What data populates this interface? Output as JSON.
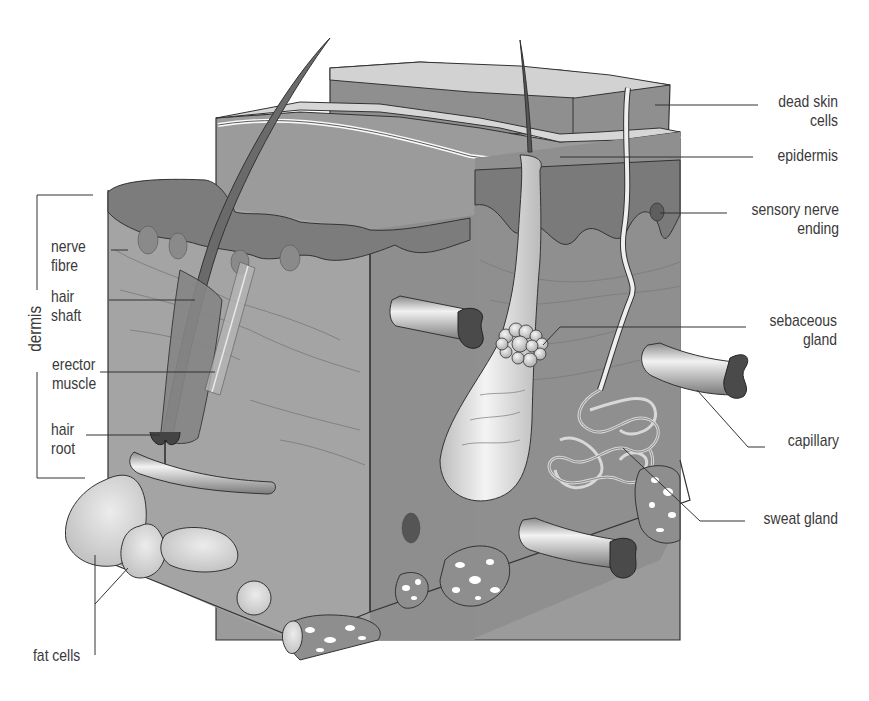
{
  "diagram": {
    "colors": {
      "background": "#ffffff",
      "tissue": "#9a9a9a",
      "tissue_dark": "#7f7f7f",
      "tissue_front": "#a6a6a6",
      "surface": "#cfcfcf",
      "dead_cells_side": "#8c8c8c",
      "epidermis_wave": "#6f6f6f",
      "follicle": "#e3e3e3",
      "fat_cell": "#d4d4d4",
      "vessel_opening": "#4a4a4a",
      "label_text": "#3a3a3a",
      "leader_line": "#333333"
    },
    "labels": {
      "dead_skin_cells": [
        "dead skin",
        "cells"
      ],
      "epidermis": [
        "epidermis"
      ],
      "sensory_nerve_ending": [
        "sensory nerve",
        "ending"
      ],
      "sebaceous_gland": [
        "sebaceous",
        "gland"
      ],
      "capillary": [
        "capillary"
      ],
      "sweat_gland": [
        "sweat gland"
      ],
      "nerve_fibre": [
        "nerve",
        "fibre"
      ],
      "hair_shaft": [
        "hair",
        "shaft"
      ],
      "erector_muscle": [
        "erector",
        "muscle"
      ],
      "hair_root": [
        "hair",
        "root"
      ],
      "fat_cells": [
        "fat cells"
      ],
      "dermis": "dermis"
    }
  }
}
